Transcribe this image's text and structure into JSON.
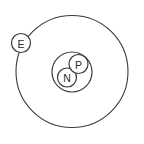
{
  "diagram": {
    "canvas": {
      "width": 144,
      "height": 144,
      "background": "#ffffff"
    },
    "style": {
      "stroke_color": "#3a3a3a",
      "fill_color": "#ffffff",
      "text_color": "#2b2b2b"
    },
    "orbit": {
      "name": "electron-orbit",
      "cx": 72,
      "cy": 71.5,
      "r": 56
    },
    "nucleus": {
      "name": "nucleus-shell",
      "cx": 72,
      "cy": 72,
      "r": 20
    },
    "particles": [
      {
        "id": "electron",
        "label": "E",
        "cx": 21,
        "cy": 43,
        "r": 9.5
      },
      {
        "id": "proton",
        "label": "P",
        "cx": 78.5,
        "cy": 64,
        "r": 9.5
      },
      {
        "id": "neutron",
        "label": "N",
        "cx": 67,
        "cy": 77.5,
        "r": 9.5
      }
    ]
  }
}
